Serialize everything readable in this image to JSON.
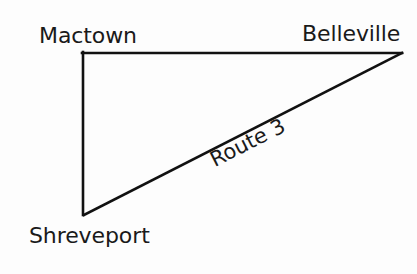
{
  "diagram": {
    "type": "right-triangle-route-map",
    "background_color": "#fdfdfd",
    "stroke_color": "#111111",
    "stroke_width": 2.6,
    "text_color": "#1a1a1a",
    "vertices": [
      {
        "id": "mactown",
        "label": "Mactown",
        "x": 82,
        "y": 53
      },
      {
        "id": "belleville",
        "label": "Belleville",
        "x": 402,
        "y": 53
      },
      {
        "id": "shreveport",
        "label": "Shreveport",
        "x": 84,
        "y": 215
      }
    ],
    "edges": [
      {
        "id": "top-edge",
        "from": "mactown",
        "to": "belleville",
        "label": ""
      },
      {
        "id": "left-edge",
        "from": "mactown",
        "to": "shreveport",
        "label": ""
      },
      {
        "id": "hypotenuse",
        "from": "shreveport",
        "to": "belleville",
        "label": "Route 3",
        "label_rotation_deg": -26.8
      }
    ],
    "labels": {
      "mactown": "Mactown",
      "belleville": "Belleville",
      "shreveport": "Shreveport",
      "route": "Route 3"
    }
  }
}
